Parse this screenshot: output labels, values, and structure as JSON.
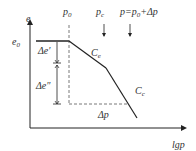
{
  "diagram": {
    "axes": {
      "y_label": "e",
      "x_label": "lgp"
    },
    "labels": {
      "e0": "e",
      "e0_sub": "0",
      "p0": "p",
      "p0_sub": "0",
      "pc": "p",
      "pc_sub": "c",
      "p_total": "p=p",
      "p_total_sub": "0",
      "p_total_tail": "+Δp",
      "delta_e1": "Δe′",
      "delta_e2": "Δe″",
      "delta_p": "Δp",
      "ce": "C",
      "ce_sub": "e",
      "cc": "C",
      "cc_sub": "c"
    },
    "colors": {
      "line": "#222222",
      "dashed": "#555555",
      "text": "#333333"
    }
  }
}
